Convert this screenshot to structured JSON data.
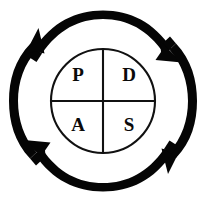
{
  "figure": {
    "name": "PDSA cycle diagram",
    "background_color": "#ffffff",
    "stroke_color": "#111111",
    "arrow_color": "#050505",
    "text_color": "#0a0a0a"
  },
  "inner_circle": {
    "center_x": 103,
    "center_y": 101,
    "radius": 52,
    "divided": true,
    "divider_count": 2
  },
  "quadrants": [
    {
      "id": "plan",
      "label": "P",
      "position": "top-left",
      "cx": 78,
      "cy": 76
    },
    {
      "id": "do",
      "label": "D",
      "position": "top-right",
      "cx": 128,
      "cy": 76
    },
    {
      "id": "act",
      "label": "A",
      "position": "bottom-left",
      "cx": 78,
      "cy": 126
    },
    {
      "id": "study",
      "label": "S",
      "position": "bottom-right",
      "cx": 128,
      "cy": 126
    }
  ],
  "arrows": {
    "count": 4,
    "direction": "clockwise",
    "ring_radius": 85,
    "items": [
      {
        "id": "arc-top",
        "position": "top",
        "head": "right"
      },
      {
        "id": "arc-right",
        "position": "right",
        "head": "bottom"
      },
      {
        "id": "arc-bottom",
        "position": "bottom",
        "head": "left"
      },
      {
        "id": "arc-left",
        "position": "left",
        "head": "top"
      }
    ]
  }
}
